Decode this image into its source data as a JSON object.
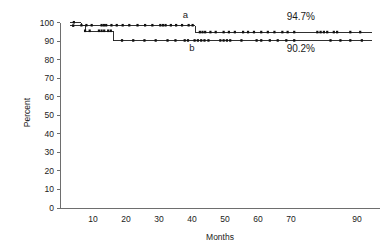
{
  "chart_data": {
    "type": "line",
    "title": "",
    "xlabel": "Months",
    "ylabel": "Percent",
    "xlim": [
      0,
      97
    ],
    "ylim": [
      0,
      103
    ],
    "grid": false,
    "legend_position": "inline-annotation",
    "x_ticks": [
      10,
      20,
      30,
      40,
      50,
      60,
      70,
      90
    ],
    "x_tick_labels": [
      "10",
      "20",
      "30",
      "40",
      "50",
      "60",
      "70",
      "90"
    ],
    "y_ticks": [
      0,
      10,
      20,
      30,
      40,
      50,
      60,
      70,
      80,
      90,
      100
    ],
    "y_tick_labels": [
      "0",
      "10",
      "20",
      "30",
      "40",
      "50",
      "60",
      "70",
      "80",
      "90",
      "100"
    ],
    "series": [
      {
        "name": "a",
        "label": "a",
        "label_x": 38,
        "label_y": 102.5,
        "end_label": "94.7%",
        "end_label_x": 73,
        "end_label_y": 101.5,
        "color": "#1a1a1a",
        "steps": [
          [
            3.0,
            100.0
          ],
          [
            6.5,
            100.0
          ],
          [
            6.5,
            98.4
          ],
          [
            41.0,
            98.4
          ],
          [
            41.0,
            94.7
          ],
          [
            94.5,
            94.7
          ]
        ],
        "censor_x": [
          4.2,
          6.5,
          8.0,
          9.6,
          12.6,
          13.3,
          14.0,
          15.6,
          17.2,
          19.0,
          21.0,
          23.5,
          25.8,
          28.0,
          30.4,
          31.2,
          32.0,
          33.6,
          35.2,
          37.0,
          39.0,
          40.2,
          42.4,
          43.2,
          44.0,
          45.6,
          47.2,
          49.6,
          51.2,
          53.0,
          55.5,
          57.0,
          58.8,
          61.0,
          63.0,
          65.0,
          67.4,
          69.0,
          71.0,
          78.0,
          79.0,
          80.0,
          81.0,
          83.0,
          84.0,
          88.0,
          91.0
        ],
        "final_percent": 94.7
      },
      {
        "name": "b",
        "label": "b",
        "label_x": 40,
        "label_y": 84.5,
        "end_label": "90.2%",
        "end_label_x": 73,
        "end_label_y": 84.0,
        "color": "#1a1a1a",
        "steps": [
          [
            3.0,
            98.2
          ],
          [
            7.6,
            98.2
          ],
          [
            7.6,
            95.4
          ],
          [
            16.2,
            95.4
          ],
          [
            16.2,
            90.2
          ],
          [
            94.5,
            90.2
          ]
        ],
        "censor_x": [
          4.0,
          7.6,
          9.0,
          11.8,
          12.6,
          13.4,
          14.6,
          15.4,
          18.8,
          22.2,
          25.6,
          29.0,
          32.6,
          35.0,
          37.8,
          38.8,
          40.8,
          41.8,
          42.8,
          43.8,
          45.0,
          48.6,
          49.6,
          50.6,
          51.6,
          55.0,
          59.6,
          61.0,
          63.6,
          66.0,
          68.6,
          71.0,
          82.0,
          85.0,
          88.0,
          91.5
        ],
        "final_percent": 90.2
      }
    ]
  }
}
